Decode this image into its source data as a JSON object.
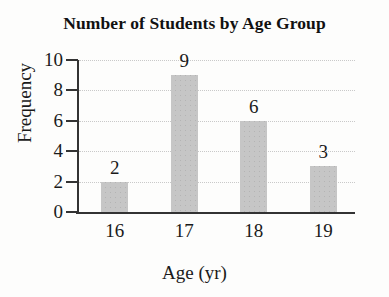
{
  "chart_data": {
    "type": "bar",
    "title": "Number of Students by Age Group",
    "xlabel": "Age (yr)",
    "ylabel": "Frequency",
    "categories": [
      "16",
      "17",
      "18",
      "19"
    ],
    "values": [
      2,
      9,
      6,
      3
    ],
    "value_labels": [
      "2",
      "9",
      "6",
      "3"
    ],
    "ylim": [
      0,
      10
    ],
    "yticks": [
      0,
      2,
      4,
      6,
      8,
      10
    ],
    "ytick_labels": [
      "0",
      "2",
      "4",
      "6",
      "8",
      "10"
    ],
    "grid": "horizontal-dotted",
    "legend": "none",
    "bar_color": "#c6c6c6",
    "axis_color": "#333333",
    "gridline_color": "#c9c9c9",
    "text_color": "#1a1a1a",
    "background": "#fdfdfc"
  }
}
